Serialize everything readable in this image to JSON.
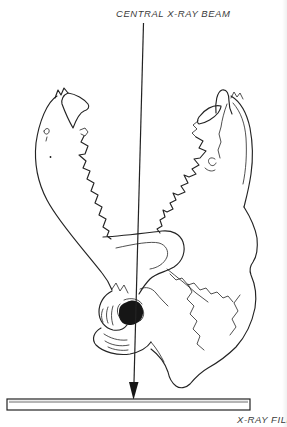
{
  "figure": {
    "beam_label": "CENTRAL X-RAY BEAM",
    "film_label": "X-RAY FILM",
    "colors": {
      "line": "#232323",
      "label_text": "#3a3a3a",
      "film_shade": "#b5b5b5",
      "background": "#ffffff",
      "condyle_fill": "#161616"
    }
  }
}
